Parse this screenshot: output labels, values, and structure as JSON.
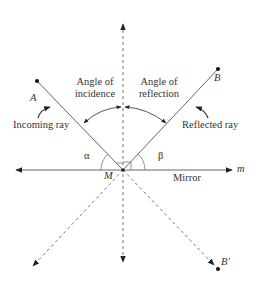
{
  "diagram": {
    "labels": {
      "angle_incidence_line1": "Angle of",
      "angle_incidence_line2": "incidence",
      "angle_reflection_line1": "Angle of",
      "angle_reflection_line2": "reflection",
      "point_a": "A",
      "point_b": "B",
      "point_b_prime": "B′",
      "point_m": "M",
      "incoming_ray": "Incoming ray",
      "reflected_ray": "Reflected ray",
      "alpha": "α",
      "beta": "β",
      "mirror": "Mirror",
      "mirror_line": "m"
    },
    "colors": {
      "line": "#555555",
      "text": "#333333",
      "point": "#111111"
    }
  }
}
